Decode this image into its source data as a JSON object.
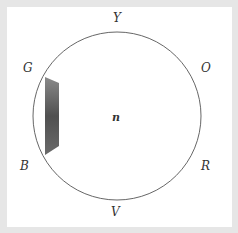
{
  "diagram": {
    "center_label": "n",
    "labels": [
      {
        "id": "Y",
        "text": "Y",
        "x": 117,
        "y": 22
      },
      {
        "id": "O",
        "text": "O",
        "x": 206,
        "y": 72
      },
      {
        "id": "R",
        "text": "R",
        "x": 206,
        "y": 170
      },
      {
        "id": "V",
        "text": "V",
        "x": 116,
        "y": 216
      },
      {
        "id": "B",
        "text": "B",
        "x": 25,
        "y": 170
      },
      {
        "id": "G",
        "text": "G",
        "x": 29,
        "y": 72
      }
    ],
    "circle": {
      "cx": 117,
      "cy": 116,
      "r": 84,
      "stroke": "#555555"
    },
    "shaded_region": {
      "fill": "#5a5a5a"
    },
    "colors": {
      "background": "#e6e6e6",
      "panel": "#ffffff"
    }
  }
}
